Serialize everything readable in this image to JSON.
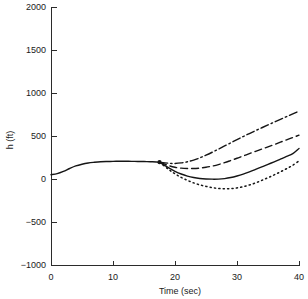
{
  "chart_data": {
    "type": "line",
    "title": "",
    "xlabel": "Time (sec)",
    "ylabel": "h (ft)",
    "xlim": [
      0,
      40
    ],
    "ylim": [
      -1000,
      2000
    ],
    "xticks": [
      0,
      10,
      20,
      30,
      40
    ],
    "yticks": [
      -1000,
      -500,
      0,
      500,
      1000,
      1500,
      2000
    ],
    "xtick_labels": [
      "0",
      "10",
      "20",
      "30",
      "40"
    ],
    "ytick_labels": [
      "-1000",
      "-500",
      "0",
      "500",
      "1000",
      "1500",
      "2000"
    ],
    "grid": false,
    "legend": "none",
    "common_segment": {
      "name": "common-trajectory",
      "x": [
        0,
        1,
        2,
        3,
        4,
        5,
        6,
        7,
        8,
        9,
        10,
        11,
        12,
        13,
        14,
        15,
        16,
        17,
        17.5
      ],
      "y": [
        50,
        62,
        88,
        122,
        152,
        172,
        186,
        194,
        200,
        203,
        205,
        206,
        206,
        205,
        204,
        203,
        201,
        198,
        196
      ]
    },
    "branch_point": {
      "x": 17.5,
      "y": 196
    },
    "series": [
      {
        "name": "dash-dot-trajectory",
        "style": "dashdot",
        "x": [
          17.5,
          19,
          20,
          21,
          22,
          23,
          24,
          25,
          26,
          27,
          28,
          29,
          30,
          31,
          32,
          33,
          34,
          35,
          36,
          37,
          38,
          39,
          40
        ],
        "y": [
          196,
          183,
          181,
          187,
          200,
          220,
          246,
          277,
          311,
          347,
          384,
          421,
          458,
          494,
          529,
          563,
          596,
          629,
          661,
          693,
          725,
          757,
          790
        ]
      },
      {
        "name": "dashed-trajectory",
        "style": "dashed",
        "x": [
          17.5,
          19,
          20,
          21,
          22,
          23,
          24,
          25,
          26,
          27,
          28,
          29,
          30,
          31,
          32,
          33,
          34,
          35,
          36,
          37,
          38,
          39,
          40
        ],
        "y": [
          196,
          155,
          136,
          126,
          122,
          122,
          127,
          136,
          150,
          168,
          190,
          215,
          241,
          268,
          295,
          322,
          348,
          374,
          400,
          428,
          455,
          482,
          510
        ]
      },
      {
        "name": "solid-trajectory",
        "style": "solid",
        "x": [
          17.5,
          19,
          20,
          21,
          22,
          23,
          24,
          25,
          26,
          27,
          28,
          29,
          30,
          31,
          32,
          33,
          34,
          35,
          36,
          37,
          38,
          39,
          40
        ],
        "y": [
          196,
          130,
          90,
          58,
          34,
          17,
          6,
          0,
          -2,
          -1,
          5,
          17,
          35,
          57,
          83,
          111,
          140,
          170,
          200,
          231,
          262,
          295,
          355
        ]
      },
      {
        "name": "dotted-trajectory",
        "style": "dotted",
        "x": [
          17.5,
          19,
          20,
          21,
          22,
          23,
          24,
          25,
          26,
          27,
          28,
          29,
          30,
          31,
          32,
          33,
          34,
          35,
          36,
          37,
          38,
          39,
          40
        ],
        "y": [
          196,
          110,
          60,
          18,
          -16,
          -45,
          -68,
          -86,
          -100,
          -110,
          -114,
          -112,
          -104,
          -90,
          -70,
          -45,
          -16,
          15,
          48,
          83,
          120,
          160,
          210
        ]
      }
    ]
  }
}
